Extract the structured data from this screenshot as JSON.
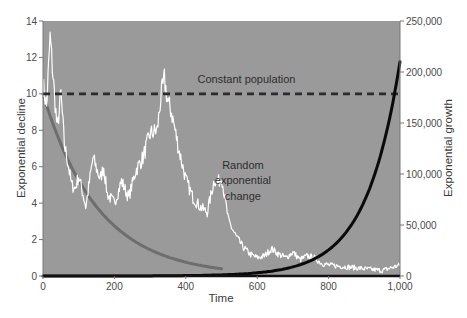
{
  "chart_data": {
    "type": "line",
    "title": "",
    "xlabel": "Time",
    "ylabel": "Exponential decline",
    "ylabel_right": "Exponential growth",
    "xlim": [
      0,
      1000
    ],
    "ylim": [
      0,
      14
    ],
    "ylim_right": [
      0,
      250000
    ],
    "x_ticks": [
      "0",
      "200",
      "400",
      "600",
      "800",
      "1,000"
    ],
    "y_ticks": [
      "0",
      "2",
      "4",
      "6",
      "8",
      "10",
      "12",
      "14"
    ],
    "y_ticks_right": [
      "0",
      "50,000",
      "100,000",
      "150,000",
      "200,000",
      "250,000"
    ],
    "grid": false,
    "legend": null,
    "background_color": "#9a9a9a",
    "annotations": [
      {
        "text": "Constant population",
        "x": 570,
        "y": 10.6
      },
      {
        "text": "Random",
        "x": 560,
        "y": 5.9
      },
      {
        "text": "exponential",
        "x": 560,
        "y": 5.05
      },
      {
        "text": "change",
        "x": 560,
        "y": 4.2
      }
    ],
    "series": [
      {
        "name": "Constant population",
        "axis": "left",
        "style": "dashed",
        "color": "#2b2b2b",
        "x": [
          0,
          1000
        ],
        "values": [
          10,
          10
        ]
      },
      {
        "name": "Exponential decline",
        "axis": "left",
        "style": "solid",
        "color": "#6e6e6e",
        "x": [
          0,
          50,
          100,
          150,
          200,
          250,
          300,
          350,
          400,
          450,
          500
        ],
        "values": [
          10,
          7.2,
          5.3,
          3.9,
          2.8,
          2.0,
          1.4,
          1.0,
          0.7,
          0.45,
          0.3
        ]
      },
      {
        "name": "Exponential growth",
        "axis": "right",
        "style": "solid",
        "color": "#0a0a0a",
        "x": [
          0,
          300,
          400,
          500,
          600,
          700,
          750,
          800,
          850,
          900,
          950,
          1000
        ],
        "values": [
          0,
          100,
          1000,
          4000,
          12000,
          28000,
          40000,
          60000,
          85000,
          115000,
          155000,
          210000
        ]
      },
      {
        "name": "Random exponential change",
        "axis": "left",
        "style": "solid",
        "color": "#ffffff",
        "x": [
          0,
          10,
          20,
          30,
          40,
          50,
          60,
          70,
          80,
          90,
          100,
          120,
          140,
          160,
          170,
          180,
          200,
          220,
          240,
          260,
          280,
          300,
          320,
          330,
          340,
          350,
          360,
          380,
          400,
          420,
          440,
          460,
          480,
          490,
          500,
          510,
          520,
          540,
          560,
          580,
          600,
          620,
          640,
          660,
          680,
          700,
          720,
          740,
          760,
          780,
          800,
          850,
          900,
          950,
          1000
        ],
        "values": [
          10.5,
          9.3,
          13.1,
          10.5,
          8.0,
          10.0,
          7.2,
          6.2,
          5.0,
          4.8,
          5.5,
          3.8,
          6.5,
          5.3,
          6.0,
          4.5,
          4.0,
          5.2,
          4.3,
          5.8,
          6.5,
          7.8,
          8.0,
          9.8,
          10.8,
          9.5,
          9.0,
          7.0,
          5.3,
          4.3,
          3.8,
          3.5,
          5.3,
          5.1,
          5.5,
          4.2,
          3.0,
          2.2,
          1.6,
          1.2,
          1.0,
          1.1,
          1.5,
          1.2,
          1.0,
          1.3,
          0.9,
          1.1,
          1.0,
          0.7,
          0.6,
          0.5,
          0.4,
          0.3,
          0.6
        ]
      }
    ]
  }
}
